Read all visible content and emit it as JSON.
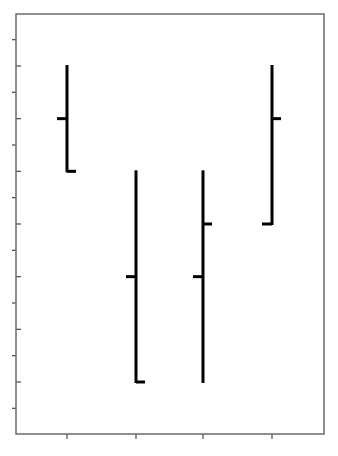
{
  "chart_data": {
    "type": "ohlc",
    "title": "",
    "xlabel": "",
    "ylabel": "",
    "categories": [
      "1",
      "2",
      "3",
      "4"
    ],
    "series": [
      {
        "name": "OHLC",
        "open": [
          6,
          3,
          3,
          4
        ],
        "high": [
          7,
          5,
          5,
          7
        ],
        "low": [
          5,
          1,
          1,
          4
        ],
        "close": [
          5,
          1,
          4,
          6
        ]
      }
    ],
    "ylim": [
      0.5,
      7.5
    ],
    "yticks_major": [
      1,
      2,
      3,
      4,
      5,
      6,
      7
    ],
    "yticks_minor": [
      0.5,
      1.5,
      2.5,
      3.5,
      4.5,
      5.5,
      6.5,
      7.5
    ],
    "grid": false,
    "legend": null,
    "tick_labels_visible": false,
    "colors": {
      "bars": "#000000",
      "frame": "#6a6a6a",
      "background": "#ffffff"
    }
  },
  "layout": {
    "plot": {
      "left": 16,
      "top": 14,
      "right": 324,
      "bottom": 434
    },
    "x_positions": [
      67,
      136,
      203,
      272
    ],
    "y_px_per_unit": 52.67,
    "y_px_at_1": 382,
    "tick_half_width": 9
  }
}
